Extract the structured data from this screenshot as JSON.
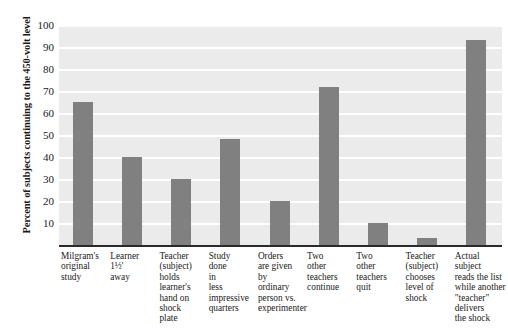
{
  "chart_data": {
    "type": "bar",
    "title": "",
    "subtitle": "",
    "xlabel": "",
    "ylabel": "Percent of subjects continuing to the 450-volt level",
    "ylim": [
      0,
      100
    ],
    "ytick_step": 10,
    "yticks": [
      100,
      90,
      80,
      70,
      60,
      50,
      40,
      30,
      20,
      10
    ],
    "grid": true,
    "grid_axis": "y",
    "legend": false,
    "legend_position": "none",
    "orientation": "vertical",
    "categories": [
      "Milgram's\noriginal\nstudy",
      "Learner\n1½'\naway",
      "Teacher\n(subject)\nholds\nlearner's\nhand on\nshock\nplate",
      "Study\ndone\nin\nless\nimpressive\nquarters",
      "Orders\nare given\nby\nordinary\nperson vs.\nexperimenter",
      "Two\nother\nteachers\ncontinue",
      "Two\nother\nteachers\nquit",
      "Teacher\n(subject)\nchooses\nlevel of\nshock",
      "Actual subject\nreads the list\nwhile another\n\"teacher\"\ndelivers\nthe shock"
    ],
    "values": [
      65,
      40,
      30,
      48,
      20,
      72,
      10,
      3,
      93
    ],
    "bar_color": "#808080",
    "plot_background": "#ebebeb",
    "gridline_color": "#ffffff",
    "axis_color": "#2a2a2a"
  }
}
